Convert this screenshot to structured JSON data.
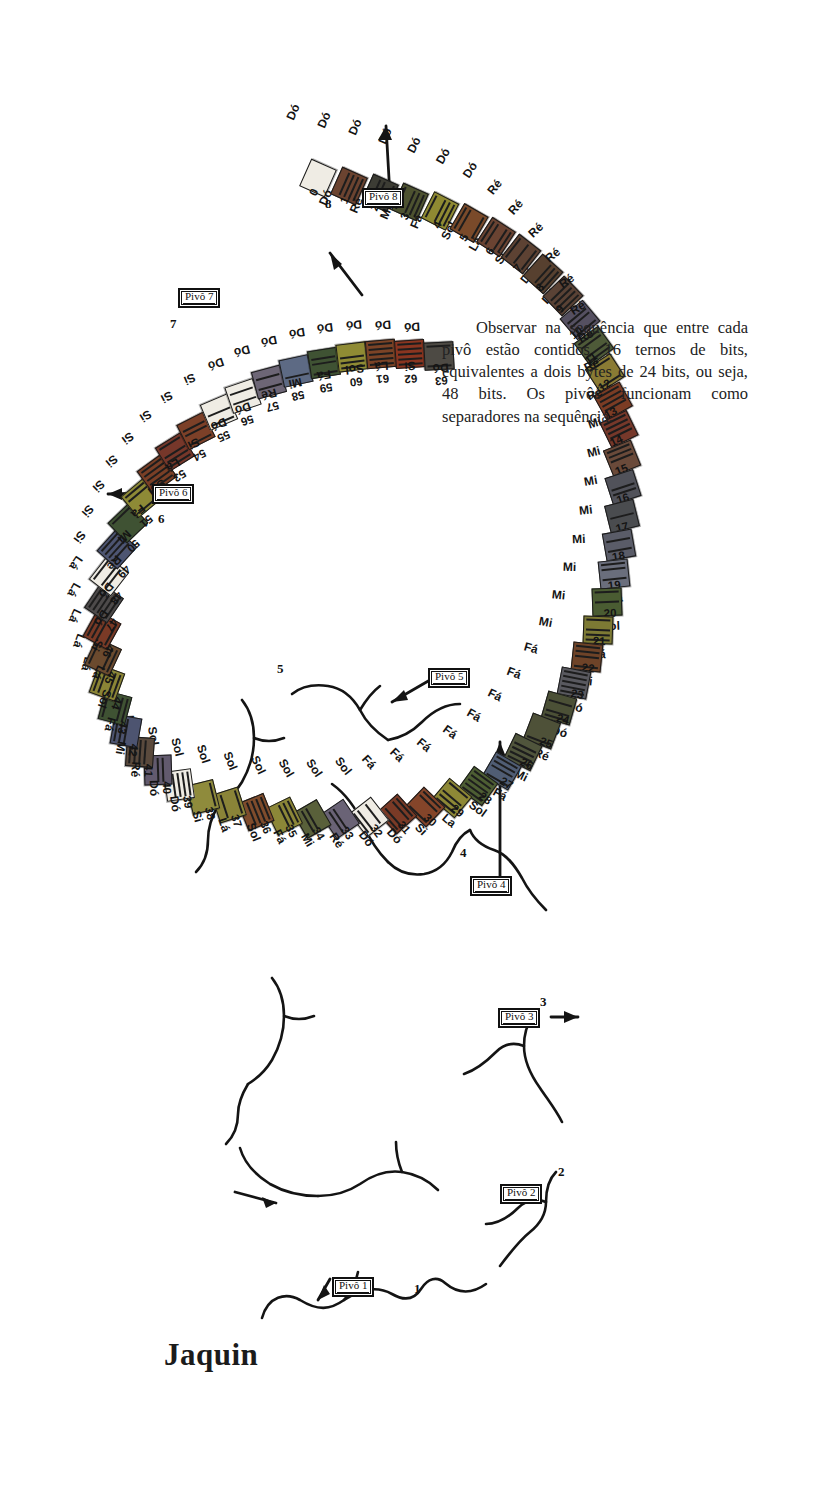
{
  "title": "Jaquin",
  "note_paragraph": "Observar na sequência que entre cada pivô estão contidos 16 ternos de bits, equivalentes a dois bytes de 24 bits, ou seja, 48 bits. Os pivôs funcionam como separadores na sequência.",
  "colors": {
    "ink": "#1b1b1b",
    "paper": "#ffffff",
    "cell_default": "#f2f0ea"
  },
  "pivots": [
    {
      "label": "Pivô 1",
      "index_number": "1"
    },
    {
      "label": "Pivô 2",
      "index_number": "2"
    },
    {
      "label": "Pivô 3",
      "index_number": "3"
    },
    {
      "label": "Pivô 4",
      "index_number": "4"
    },
    {
      "label": "Pivô 5",
      "index_number": "5"
    },
    {
      "label": "Pivô 6",
      "index_number": "6"
    },
    {
      "label": "Pivô 7",
      "index_number": "7"
    },
    {
      "label": "Pivô 8",
      "index_number": "8"
    }
  ],
  "sequence_info": {
    "first_index": "0",
    "last_index": "63",
    "total_cells": 64
  },
  "cells": [
    {
      "n": "0",
      "note": "Dó",
      "below": "Dó",
      "fill": "#efece4",
      "x": 303,
      "y": 1337,
      "rot": -24,
      "lx": 285,
      "ly": 1395,
      "lrot": -24,
      "bx": 312,
      "by": 1318,
      "brot": -24
    },
    {
      "n": "1",
      "note": "Ré",
      "below": "Dó",
      "fill": "#6b4330",
      "x": 334,
      "y": 1329,
      "rot": -24,
      "lx": 316,
      "ly": 1387,
      "lrot": -24,
      "bx": 343,
      "by": 1310,
      "brot": -24
    },
    {
      "n": "2",
      "note": "Mi",
      "below": "Dó",
      "fill": "#3c3c34",
      "x": 365,
      "y": 1322,
      "rot": -24,
      "lx": 347,
      "ly": 1380,
      "lrot": -24,
      "bx": 374,
      "by": 1303,
      "brot": -24
    },
    {
      "n": "3",
      "note": "Fá",
      "below": "Dó",
      "fill": "#4d5230",
      "x": 395,
      "y": 1313,
      "rot": -24,
      "lx": 377,
      "ly": 1371,
      "lrot": -24,
      "bx": 404,
      "by": 1294,
      "brot": -24
    },
    {
      "n": "4",
      "note": "Sol",
      "below": "Dó",
      "fill": "#8f8a32",
      "x": 425,
      "y": 1304,
      "rot": -27,
      "lx": 406,
      "ly": 1362,
      "lrot": -27,
      "bx": 434,
      "by": 1285,
      "brot": -27
    },
    {
      "n": "5",
      "note": "Lá",
      "below": "Dó",
      "fill": "#7a4a2a",
      "x": 454,
      "y": 1292,
      "rot": -30,
      "lx": 435,
      "ly": 1351,
      "lrot": -30,
      "bx": 463,
      "by": 1272,
      "brot": -30
    },
    {
      "n": "6",
      "note": "Si",
      "below": "Dó",
      "fill": "#6a4332",
      "x": 481,
      "y": 1278,
      "rot": -33,
      "lx": 462,
      "ly": 1337,
      "lrot": -33,
      "bx": 490,
      "by": 1258,
      "brot": -33
    },
    {
      "n": "7",
      "note": "Dó",
      "below": "Ré",
      "fill": "#5d4233",
      "x": 506,
      "y": 1261,
      "rot": -38,
      "lx": 487,
      "ly": 1320,
      "lrot": -38,
      "bx": 515,
      "by": 1241,
      "brot": -38
    },
    {
      "n": "8",
      "note": "Dó",
      "below": "Ré",
      "fill": "#57402f",
      "x": 528,
      "y": 1241,
      "rot": -42,
      "lx": 508,
      "ly": 1300,
      "lrot": -42,
      "bx": 537,
      "by": 1221,
      "brot": -42
    },
    {
      "n": "9",
      "note": "Ré",
      "below": "Ré",
      "fill": "#5a4235",
      "x": 548,
      "y": 1219,
      "rot": -46,
      "lx": 528,
      "ly": 1277,
      "lrot": -46,
      "bx": 557,
      "by": 1199,
      "brot": -46
    },
    {
      "n": "10",
      "note": "Mi",
      "below": "Ré",
      "fill": "#555061",
      "x": 565,
      "y": 1195,
      "rot": -50,
      "lx": 545,
      "ly": 1252,
      "lrot": -50,
      "bx": 574,
      "by": 1175,
      "brot": -50
    },
    {
      "n": "11",
      "note": "Fá",
      "below": "Ré",
      "fill": "#4e5a38",
      "x": 579,
      "y": 1169,
      "rot": -54,
      "lx": 559,
      "ly": 1226,
      "lrot": -54,
      "bx": 588,
      "by": 1149,
      "brot": -54
    },
    {
      "n": "12",
      "note": "Sol",
      "below": "Ré",
      "fill": "#8a7b34",
      "x": 590,
      "y": 1142,
      "rot": -57,
      "lx": 570,
      "ly": 1199,
      "lrot": -57,
      "bx": 599,
      "by": 1122,
      "brot": -57
    },
    {
      "n": "13",
      "note": "Lá",
      "below": "Ré",
      "fill": "#7b3c24",
      "x": 598,
      "y": 1114,
      "rot": -61,
      "lx": 578,
      "ly": 1171,
      "lrot": -61,
      "bx": 607,
      "by": 1094,
      "brot": -61
    },
    {
      "n": "14",
      "note": "Si",
      "below": "Ré",
      "fill": "#76382a",
      "x": 604,
      "y": 1086,
      "rot": -64,
      "lx": 584,
      "ly": 1142,
      "lrot": -64,
      "bx": 613,
      "by": 1066,
      "brot": -64
    },
    {
      "n": "15",
      "note": "Dó",
      "below": "Ré",
      "fill": "#6a4a3a",
      "x": 607,
      "y": 1057,
      "rot": -68,
      "lx": 587,
      "ly": 1113,
      "lrot": -68,
      "bx": 616,
      "by": 1037,
      "brot": -68
    },
    {
      "n": "16",
      "note": "Dó",
      "below": "Mi",
      "fill": "#51525a",
      "x": 608,
      "y": 1028,
      "rot": -72,
      "lx": 588,
      "ly": 1084,
      "lrot": -72,
      "bx": 617,
      "by": 1008,
      "brot": -72
    },
    {
      "n": "17",
      "note": "Ré",
      "below": "Mi",
      "fill": "#4a4c4f",
      "x": 607,
      "y": 999,
      "rot": -76,
      "lx": 587,
      "ly": 1055,
      "lrot": -76,
      "bx": 616,
      "by": 979,
      "brot": -76
    },
    {
      "n": "18",
      "note": "Mi",
      "below": "Mi",
      "fill": "#5a5c68",
      "x": 604,
      "y": 970,
      "rot": -80,
      "lx": 584,
      "ly": 1026,
      "lrot": -80,
      "bx": 613,
      "by": 950,
      "brot": -80
    },
    {
      "n": "19",
      "note": "Fá",
      "below": "Mi",
      "fill": "#6a6e7c",
      "x": 599,
      "y": 941,
      "rot": -84,
      "lx": 579,
      "ly": 997,
      "lrot": -84,
      "bx": 608,
      "by": 921,
      "brot": -84
    },
    {
      "n": "20",
      "note": "Sol",
      "below": "Mi",
      "fill": "#4a5c32",
      "x": 592,
      "y": 913,
      "rot": -88,
      "lx": 572,
      "ly": 968,
      "lrot": -88,
      "bx": 601,
      "by": 893,
      "brot": -88
    },
    {
      "n": "21",
      "note": "Lá",
      "below": "Mi",
      "fill": "#7d7a34",
      "x": 583,
      "y": 885,
      "rot": -92,
      "lx": 563,
      "ly": 940,
      "lrot": -92,
      "bx": 592,
      "by": 865,
      "brot": -92
    },
    {
      "n": "22",
      "note": "Si",
      "below": "Mi",
      "fill": "#6e4328",
      "x": 572,
      "y": 858,
      "rot": -96,
      "lx": 552,
      "ly": 912,
      "lrot": -96,
      "bx": 581,
      "by": 838,
      "brot": -96
    },
    {
      "n": "23",
      "note": "Dó",
      "below": "Mi",
      "fill": "#59595f",
      "x": 559,
      "y": 832,
      "rot": -101,
      "lx": 539,
      "ly": 885,
      "lrot": -101,
      "bx": 568,
      "by": 812,
      "brot": -101
    },
    {
      "n": "24",
      "note": "Dó",
      "below": "Fá",
      "fill": "#4b5036",
      "x": 544,
      "y": 807,
      "rot": -106,
      "lx": 524,
      "ly": 859,
      "lrot": -106,
      "bx": 553,
      "by": 787,
      "brot": -106
    },
    {
      "n": "25",
      "note": "Ré",
      "below": "Fá",
      "fill": "#4e5138",
      "x": 527,
      "y": 784,
      "rot": -111,
      "lx": 507,
      "ly": 834,
      "lrot": -111,
      "bx": 536,
      "by": 764,
      "brot": -111
    },
    {
      "n": "26",
      "note": "Mi",
      "below": "Fá",
      "fill": "#50553c",
      "x": 508,
      "y": 763,
      "rot": -116,
      "lx": 488,
      "ly": 812,
      "lrot": -116,
      "bx": 517,
      "by": 743,
      "brot": -116
    },
    {
      "n": "27",
      "note": "Fá",
      "below": "Fá",
      "fill": "#505d74",
      "x": 487,
      "y": 744,
      "rot": -120,
      "lx": 467,
      "ly": 792,
      "lrot": -120,
      "bx": 496,
      "by": 724,
      "brot": -120
    },
    {
      "n": "28",
      "note": "Sol",
      "below": "Fá",
      "fill": "#4d5e33",
      "x": 463,
      "y": 729,
      "rot": -126,
      "lx": 443,
      "ly": 775,
      "lrot": -126,
      "bx": 472,
      "by": 709,
      "brot": -126
    },
    {
      "n": "29",
      "note": "La",
      "below": "Fá",
      "fill": "#8d8836",
      "x": 437,
      "y": 717,
      "rot": -130,
      "lx": 417,
      "ly": 762,
      "lrot": -130,
      "bx": 446,
      "by": 697,
      "brot": -130
    },
    {
      "n": "30",
      "note": "Si",
      "below": "Fá",
      "fill": "#84452a",
      "x": 410,
      "y": 708,
      "rot": -134,
      "lx": 390,
      "ly": 752,
      "lrot": -134,
      "bx": 419,
      "by": 688,
      "brot": -134
    },
    {
      "n": "31",
      "note": "Dó",
      "below": "Fá",
      "fill": "#7a3a26",
      "x": 382,
      "y": 701,
      "rot": -138,
      "lx": 362,
      "ly": 745,
      "lrot": -138,
      "bx": 391,
      "by": 681,
      "brot": -138
    },
    {
      "n": "32",
      "note": "Dó",
      "below": "Sol",
      "fill": "#efece4",
      "x": 354,
      "y": 698,
      "rot": -142,
      "lx": 334,
      "ly": 741,
      "lrot": -142,
      "bx": 363,
      "by": 678,
      "brot": -142
    },
    {
      "n": "33",
      "note": "Ré",
      "below": "Sol",
      "fill": "#6a6376",
      "x": 325,
      "y": 696,
      "rot": -146,
      "lx": 305,
      "ly": 739,
      "lrot": -146,
      "bx": 334,
      "by": 676,
      "brot": -146
    },
    {
      "n": "34",
      "note": "Mi",
      "below": "Sol",
      "fill": "#59603a",
      "x": 297,
      "y": 696,
      "rot": -150,
      "lx": 277,
      "ly": 739,
      "lrot": -150,
      "bx": 306,
      "by": 676,
      "brot": -150
    },
    {
      "n": "35",
      "note": "Fá",
      "below": "Sol",
      "fill": "#8c8738",
      "x": 269,
      "y": 699,
      "rot": -154,
      "lx": 249,
      "ly": 742,
      "lrot": -154,
      "bx": 278,
      "by": 679,
      "brot": -154
    },
    {
      "n": "36",
      "note": "Sol",
      "below": "Sol",
      "fill": "#7f4c2c",
      "x": 241,
      "y": 703,
      "rot": -158,
      "lx": 221,
      "ly": 746,
      "lrot": -158,
      "bx": 250,
      "by": 683,
      "brot": -158
    },
    {
      "n": "37",
      "note": "Lá",
      "below": "Sol",
      "fill": "#8a8438",
      "x": 214,
      "y": 710,
      "rot": -162,
      "lx": 194,
      "ly": 753,
      "lrot": -162,
      "bx": 223,
      "by": 690,
      "brot": -162
    },
    {
      "n": "38",
      "note": "Si",
      "below": "Sol",
      "fill": "#8f8b3c",
      "x": 188,
      "y": 718,
      "rot": -166,
      "lx": 168,
      "ly": 760,
      "lrot": -166,
      "bx": 197,
      "by": 698,
      "brot": -166
    },
    {
      "n": "39",
      "note": "Dó",
      "below": "Sol",
      "fill": "#efece4",
      "x": 164,
      "y": 730,
      "rot": -172,
      "lx": 144,
      "ly": 771,
      "lrot": -172,
      "bx": 173,
      "by": 710,
      "brot": -172
    },
    {
      "n": "40",
      "note": "Dó",
      "below": "Lá",
      "fill": "#625a6e",
      "x": 143,
      "y": 745,
      "rot": -178,
      "lx": 123,
      "ly": 785,
      "lrot": -178,
      "bx": 152,
      "by": 725,
      "brot": -178
    },
    {
      "n": "41",
      "note": "Ré",
      "below": "Lá",
      "fill": "#5a4a3d",
      "x": 125,
      "y": 763,
      "rot": -184,
      "lx": 105,
      "ly": 802,
      "lrot": -184,
      "bx": 134,
      "by": 743,
      "brot": -184
    },
    {
      "n": "42",
      "note": "Mi",
      "below": "Lá",
      "fill": "#4d5470",
      "x": 111,
      "y": 784,
      "rot": -190,
      "lx": 91,
      "ly": 821,
      "lrot": -190,
      "bx": 120,
      "by": 764,
      "brot": -190
    },
    {
      "n": "43",
      "note": "Fá",
      "below": "Lá",
      "fill": "#3f5233",
      "x": 100,
      "y": 807,
      "rot": -195,
      "lx": 80,
      "ly": 843,
      "lrot": -195,
      "bx": 109,
      "by": 787,
      "brot": -195
    },
    {
      "n": "44",
      "note": "Sol",
      "below": "Lá",
      "fill": "#8b8536",
      "x": 92,
      "y": 832,
      "rot": -200,
      "lx": 72,
      "ly": 866,
      "lrot": -200,
      "bx": 101,
      "by": 812,
      "brot": -200
    },
    {
      "n": "45",
      "note": "Lá",
      "below": "Lá",
      "fill": "#6b4a2e",
      "x": 88,
      "y": 858,
      "rot": -205,
      "lx": 68,
      "ly": 891,
      "lrot": -205,
      "bx": 97,
      "by": 838,
      "brot": -205
    },
    {
      "n": "46",
      "note": "Si",
      "below": "Lá",
      "fill": "#7a3a26",
      "x": 87,
      "y": 885,
      "rot": -209,
      "lx": 67,
      "ly": 917,
      "lrot": -209,
      "bx": 96,
      "by": 865,
      "brot": -209
    },
    {
      "n": "47",
      "note": "Dó",
      "below": "Lá",
      "fill": "#4d4a4a",
      "x": 89,
      "y": 912,
      "rot": -214,
      "lx": 69,
      "ly": 944,
      "lrot": -214,
      "bx": 98,
      "by": 892,
      "brot": -214
    },
    {
      "n": "48",
      "note": "Dó",
      "below": "Si",
      "fill": "#efece4",
      "x": 94,
      "y": 939,
      "rot": -218,
      "lx": 74,
      "ly": 970,
      "lrot": -218,
      "bx": 103,
      "by": 919,
      "brot": -218
    },
    {
      "n": "49",
      "note": "Ré",
      "below": "Si",
      "fill": "#4d5572",
      "x": 102,
      "y": 966,
      "rot": -222,
      "lx": 82,
      "ly": 996,
      "lrot": -222,
      "bx": 111,
      "by": 946,
      "brot": -222
    },
    {
      "n": "50",
      "note": "Mi",
      "below": "Si",
      "fill": "#3f5233",
      "x": 113,
      "y": 992,
      "rot": -226,
      "lx": 93,
      "ly": 1021,
      "lrot": -226,
      "bx": 122,
      "by": 972,
      "brot": -226
    },
    {
      "n": "51",
      "note": "Fá",
      "below": "Si",
      "fill": "#8e8a36",
      "x": 126,
      "y": 1017,
      "rot": -230,
      "lx": 106,
      "ly": 1046,
      "lrot": -230,
      "bx": 135,
      "by": 997,
      "brot": -230
    },
    {
      "n": "52",
      "note": "Sol",
      "below": "Si",
      "fill": "#7a3f26",
      "x": 142,
      "y": 1041,
      "rot": -234,
      "lx": 122,
      "ly": 1069,
      "lrot": -234,
      "bx": 151,
      "by": 1021,
      "brot": -234
    },
    {
      "n": "53",
      "note": "Lá",
      "below": "Si",
      "fill": "#76372a",
      "x": 160,
      "y": 1063,
      "rot": -238,
      "lx": 140,
      "ly": 1091,
      "lrot": -238,
      "bx": 169,
      "by": 1043,
      "brot": -238
    },
    {
      "n": "54",
      "note": "Si",
      "below": "Si",
      "fill": "#7c4028",
      "x": 181,
      "y": 1084,
      "rot": -243,
      "lx": 161,
      "ly": 1110,
      "lrot": -243,
      "bx": 190,
      "by": 1064,
      "brot": -243
    },
    {
      "n": "55",
      "note": "Dó",
      "below": "Si",
      "fill": "#efece4",
      "x": 204,
      "y": 1103,
      "rot": -247,
      "lx": 184,
      "ly": 1128,
      "lrot": -247,
      "bx": 213,
      "by": 1083,
      "brot": -247
    },
    {
      "n": "56",
      "note": "Dó",
      "below": "Dó",
      "fill": "#efece4",
      "x": 228,
      "y": 1119,
      "rot": -251,
      "lx": 208,
      "ly": 1143,
      "lrot": -251,
      "bx": 237,
      "by": 1099,
      "brot": -251
    },
    {
      "n": "57",
      "note": "Ré",
      "below": "Dó",
      "fill": "#6d6676",
      "x": 254,
      "y": 1133,
      "rot": -255,
      "lx": 234,
      "ly": 1156,
      "lrot": -255,
      "bx": 263,
      "by": 1113,
      "brot": -255
    },
    {
      "n": "58",
      "note": "Mi",
      "below": "Dó",
      "fill": "#5d6a84",
      "x": 281,
      "y": 1144,
      "rot": -258,
      "lx": 261,
      "ly": 1166,
      "lrot": -258,
      "bx": 290,
      "by": 1124,
      "brot": -258
    },
    {
      "n": "59",
      "note": "Fá",
      "below": "Dó",
      "fill": "#3f5233",
      "x": 309,
      "y": 1152,
      "rot": -261,
      "lx": 289,
      "ly": 1174,
      "lrot": -261,
      "bx": 318,
      "by": 1132,
      "brot": -261
    },
    {
      "n": "60",
      "note": "Sol",
      "below": "Dó",
      "fill": "#8f8b34",
      "x": 337,
      "y": 1158,
      "rot": -263,
      "lx": 317,
      "ly": 1179,
      "lrot": -263,
      "bx": 346,
      "by": 1138,
      "brot": -263
    },
    {
      "n": "61",
      "note": "Lá",
      "below": "Dó",
      "fill": "#7b4326",
      "x": 366,
      "y": 1161,
      "rot": -265,
      "lx": 346,
      "ly": 1182,
      "lrot": -265,
      "bx": 375,
      "by": 1141,
      "brot": -265
    },
    {
      "n": "62",
      "note": "Si",
      "below": "Dó",
      "fill": "#8a3520",
      "x": 395,
      "y": 1161,
      "rot": -266,
      "lx": 375,
      "ly": 1182,
      "lrot": -266,
      "bx": 404,
      "by": 1141,
      "brot": -266
    },
    {
      "n": "63",
      "note": "Dó",
      "below": "Dó",
      "fill": "#4d4a44",
      "x": 424,
      "y": 1159,
      "rot": -267,
      "lx": 404,
      "ly": 1180,
      "lrot": -267,
      "bx": 433,
      "by": 1139,
      "brot": -267
    }
  ]
}
